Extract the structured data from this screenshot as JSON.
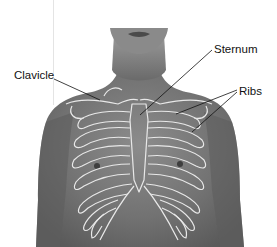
{
  "figure": {
    "type": "anatomical-diagram",
    "labels": [
      {
        "text": "Clavicle",
        "x": 14,
        "y": 70,
        "target_x": 100,
        "target_y": 100
      },
      {
        "text": "Sternum",
        "x": 214,
        "y": 44,
        "target_x": 140,
        "target_y": 115
      },
      {
        "text": "Ribs",
        "x": 239,
        "y": 86,
        "targets": [
          [
            176,
            114
          ],
          [
            192,
            132
          ]
        ]
      }
    ],
    "colors": {
      "background": "#ffffff",
      "skin": "#6e6e6e",
      "skin_light": "#9a9a9a",
      "outline": "#e8e8e8",
      "leader": "#111111",
      "text": "#111111"
    }
  }
}
